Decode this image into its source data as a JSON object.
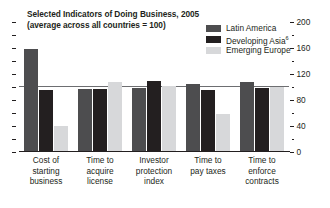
{
  "chart": {
    "title_line1": "Selected Indicators of Doing Business, 2005",
    "title_line2": "(average across all countries = 100)"
  },
  "chart_data": {
    "type": "bar",
    "title": "Selected Indicators of Doing Business, 2005 (average across all countries = 100)",
    "subtitle": "(average across all countries = 100)",
    "xlabel": "",
    "ylabel": "",
    "ylim": [
      0,
      200
    ],
    "yticks": [
      0,
      40,
      80,
      120,
      160,
      200
    ],
    "ytick_labels": [
      "0",
      "40",
      "80",
      "120",
      "160",
      "200"
    ],
    "minor_ticks": [
      20,
      60,
      100,
      140,
      180
    ],
    "grid": false,
    "reference_line": 100,
    "legend_position": "top-right",
    "axis_side": "right",
    "categories": [
      "Cost of starting business",
      "Time to acquire license",
      "Investor protection index",
      "Time to pay taxes",
      "Time to enforce contracts"
    ],
    "series": [
      {
        "name": "Latin America",
        "color": "#4d4d4f",
        "values": [
          158,
          97,
          99,
          105,
          108
        ]
      },
      {
        "name": "Developing Asia",
        "color": "#231f20",
        "values": [
          95,
          97,
          110,
          95,
          98
        ]
      },
      {
        "name": "Emerging Europe",
        "color": "#d7d8da",
        "values": [
          40,
          108,
          102,
          58,
          100
        ]
      }
    ]
  },
  "legend": {
    "items": [
      {
        "label": "Latin America",
        "footnote": ""
      },
      {
        "label": "Developing Asia",
        "footnote": "6"
      },
      {
        "label": "Emerging Europe",
        "footnote": ""
      }
    ]
  },
  "xaxis": {
    "labels": [
      [
        "Cost of starting",
        "business"
      ],
      [
        "Time to",
        "acquire",
        "license"
      ],
      [
        "Investor",
        "protection",
        "index"
      ],
      [
        "Time to",
        "pay taxes"
      ],
      [
        "Time to enforce",
        "contracts"
      ]
    ]
  }
}
